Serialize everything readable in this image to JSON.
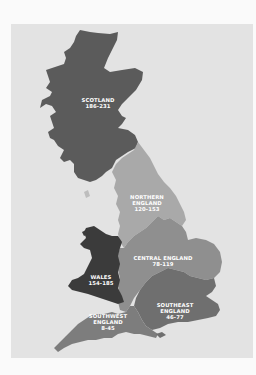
{
  "map": {
    "colors": {
      "page_background": "#fafafa",
      "panel_background": "#e3e3e3",
      "scotland": "#5b5b5b",
      "northern_england": "#a9a9a9",
      "wales": "#3b3b3b",
      "central_england": "#8f8f8f",
      "southeast_england": "#6f6f6f",
      "southwest_england": "#7d7d7d",
      "label_text": "#ffffff"
    },
    "regions": [
      {
        "name": "SCOTLAND",
        "range": "186-231"
      },
      {
        "name": "NORTHERN",
        "name2": "ENGLAND",
        "range": "120-153"
      },
      {
        "name": "WALES",
        "range": "154-185"
      },
      {
        "name": "CENTRAL ENGLAND",
        "range": "78-119"
      },
      {
        "name": "SOUTHEAST",
        "name2": "ENGLAND",
        "range": "46-77"
      },
      {
        "name": "SOUTHWEST",
        "name2": "ENGLAND",
        "range": "8-45"
      }
    ]
  }
}
